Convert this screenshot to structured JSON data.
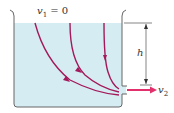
{
  "diagram": {
    "labels": {
      "v1_var": "v",
      "v1_sub": "1",
      "v1_eq": " = 0",
      "h": "h",
      "v2_var": "v",
      "v2_sub": "2"
    },
    "colors": {
      "water": "#d6ecf3",
      "container": "#666666",
      "streamline": "#a3195b",
      "jet_arrow": "#e2306c",
      "dimension": "#333333"
    },
    "streamlines": 3
  }
}
